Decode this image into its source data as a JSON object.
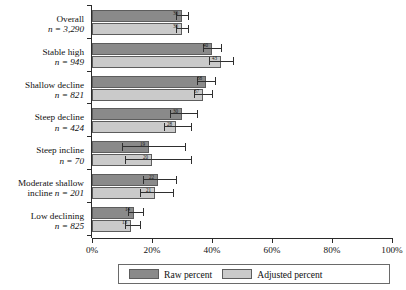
{
  "chart_data": {
    "type": "bar",
    "orientation": "horizontal",
    "title": "",
    "xlabel": "",
    "ylabel": "",
    "xlim": [
      0,
      100
    ],
    "xticks": [
      "0%",
      "20%",
      "40%",
      "60%",
      "80%",
      "100%"
    ],
    "xtick_values": [
      0,
      20,
      40,
      60,
      80,
      100
    ],
    "grid": false,
    "legend_position": "bottom",
    "categories": [
      "Overall",
      "Stable high",
      "Shallow decline",
      "Steep decline",
      "Steep incline",
      "Moderate shallow incline",
      "Low declining"
    ],
    "category_n_labels": [
      "n = 3,290",
      "n = 949",
      "n = 821",
      "n = 424",
      "n = 70",
      "n = 201",
      "n = 825"
    ],
    "n_values": [
      3290,
      949,
      821,
      424,
      70,
      201,
      825
    ],
    "series": [
      {
        "name": "Raw percent",
        "color": "#8a8a8a",
        "values": [
          30,
          40,
          38,
          30,
          19,
          22,
          14
        ],
        "ci_low": [
          28,
          37,
          35,
          26,
          10,
          17,
          12
        ],
        "ci_high": [
          32,
          43,
          41,
          35,
          31,
          28,
          17
        ],
        "labels": [
          "30",
          "40",
          "38",
          "30",
          "19",
          "22",
          "14"
        ]
      },
      {
        "name": "Adjusted percent",
        "color": "#cacaca",
        "values": [
          30,
          43,
          37,
          28,
          20,
          21,
          13
        ],
        "ci_low": [
          28,
          39,
          34,
          24,
          11,
          16,
          11
        ],
        "ci_high": [
          32,
          47,
          40,
          33,
          33,
          27,
          16
        ],
        "labels": [
          "30",
          "43",
          "37",
          "28",
          "20",
          "21",
          "13"
        ]
      }
    ]
  },
  "legend": {
    "items": [
      {
        "label": "Raw percent",
        "swatch": "raw"
      },
      {
        "label": "Adjusted percent",
        "swatch": "adj"
      }
    ]
  }
}
